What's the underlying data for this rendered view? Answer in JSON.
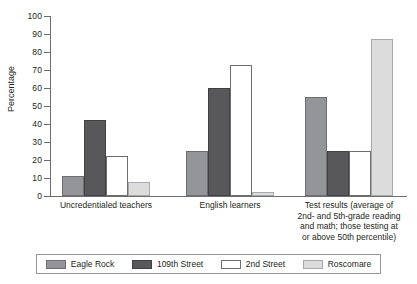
{
  "chart_data": {
    "type": "bar",
    "title": "",
    "xlabel": "",
    "ylabel": "Percentage",
    "ylim": [
      0,
      100
    ],
    "ytick_step": 10,
    "yticks": [
      100,
      90,
      80,
      70,
      60,
      50,
      40,
      30,
      20,
      10,
      0
    ],
    "grid": false,
    "legend_position": "bottom",
    "categories": [
      "Uncredentialed teachers",
      "English learners",
      "Test results (average of 2nd- and 5th-grade reading and math; those testing at or above 50th percentile)"
    ],
    "category_lines": [
      [
        "Uncredentialed teachers"
      ],
      [
        "English learners"
      ],
      [
        "Test results (average of",
        "2nd- and 5th-grade reading",
        "and math; those testing at",
        "or above 50th percentile)"
      ]
    ],
    "series": [
      {
        "name": "Eagle Rock",
        "color": "#949598",
        "values": [
          11,
          25,
          55
        ]
      },
      {
        "name": "109th Street",
        "color": "#58585a",
        "values": [
          42,
          60,
          25
        ]
      },
      {
        "name": "2nd Street",
        "color": "#ffffff",
        "values": [
          22,
          73,
          25
        ]
      },
      {
        "name": "Roscomare",
        "color": "#dcdcdc",
        "values": [
          8,
          2,
          87
        ]
      }
    ]
  },
  "axis": {
    "y_title": "Percentage"
  },
  "colors": {
    "axis": "#6d6e71",
    "text": "#231f20",
    "legend_border": "#939598",
    "background": "#ffffff"
  }
}
